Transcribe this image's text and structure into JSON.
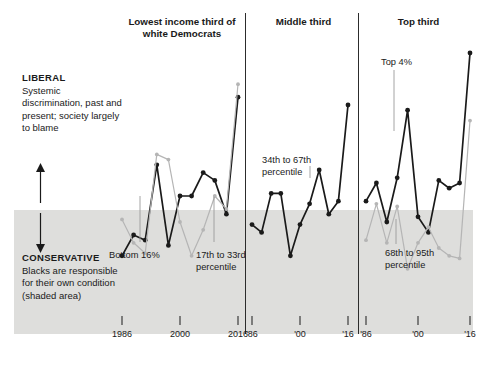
{
  "axis_labels": {
    "liberal": {
      "caption": "LIBERAL",
      "body": "Systemic discrimination, past and present; society largely to blame"
    },
    "conservative": {
      "caption": "CONSERVATIVE",
      "body": "Blacks are responsible for their own condition (shaded area)"
    },
    "up_arrow_icon": "up-arrow-icon",
    "down_arrow_icon": "down-arrow-icon"
  },
  "panels": [
    {
      "title": "Lowest income third of white Democrats",
      "ticks": [
        "1986",
        "2000",
        "2016"
      ]
    },
    {
      "title": "Middle third",
      "ticks": [
        "'86",
        "'00",
        "'16"
      ]
    },
    {
      "title": "Top third",
      "ticks": [
        "'86",
        "'00",
        "'16"
      ]
    }
  ],
  "annotations": {
    "bottom16": "Bottom 16%",
    "p17to33": "17th to 33rd percentile",
    "p34to67": "34th to 67th percentile",
    "top4": "Top 4%",
    "p68to95": "68th to 95th percentile"
  },
  "colors": {
    "dark_series": "#1a1a1a",
    "light_series": "#b5b5b5",
    "shaded_band": "#dededc",
    "divider": "#2c2c2c",
    "text": "#1a1a1a"
  },
  "chart_data": {
    "type": "line",
    "title": "",
    "subtitle": "",
    "xlabel": "",
    "ylabel": "",
    "grid": false,
    "legend_position": "inline-annotations",
    "y_axis_description": "Scale runs from CONSERVATIVE (Blacks are responsible for their own condition — shaded lower area) at the bottom to LIBERAL (Systemic discrimination, past and present; society largely to blame) at the top",
    "shaded_region": {
      "label": "CONSERVATIVE (shaded area)",
      "y_from_bottom": 0,
      "y_to": 0.37
    },
    "panels": [
      {
        "name": "Lowest income third of white Democrats",
        "x_ticks": [
          "1986",
          "2000",
          "2016"
        ],
        "x": [
          1986,
          1988,
          1990,
          1992,
          1994,
          1996,
          2000,
          2004,
          2008,
          2012,
          2016
        ],
        "series": [
          {
            "name": "Bottom 16%",
            "color": "#1a1a1a",
            "values": [
              0.17,
              0.25,
              0.23,
              0.52,
              0.21,
              0.4,
              0.4,
              0.49,
              0.46,
              0.33,
              0.78
            ]
          },
          {
            "name": "17th to 33rd percentile",
            "color": "#b5b5b5",
            "values": [
              0.31,
              0.22,
              0.18,
              0.56,
              0.54,
              0.3,
              0.17,
              0.27,
              0.4,
              0.35,
              0.83
            ]
          }
        ]
      },
      {
        "name": "Middle third",
        "x_ticks": [
          "'86",
          "'00",
          "'16"
        ],
        "x": [
          1986,
          1988,
          1990,
          1992,
          1994,
          1996,
          2000,
          2004,
          2008,
          2012,
          2016
        ],
        "series": [
          {
            "name": "34th to 67th percentile",
            "color": "#1a1a1a",
            "values": [
              0.29,
              0.26,
              0.41,
              0.41,
              0.17,
              0.29,
              0.37,
              0.5,
              0.33,
              0.38,
              0.75
            ]
          }
        ]
      },
      {
        "name": "Top third",
        "x_ticks": [
          "'86",
          "'00",
          "'16"
        ],
        "x": [
          1986,
          1988,
          1990,
          1992,
          1994,
          1996,
          2000,
          2004,
          2008,
          2012,
          2016
        ],
        "series": [
          {
            "name": "Top 4%",
            "color": "#1a1a1a",
            "values": [
              0.38,
              0.45,
              0.3,
              0.47,
              0.73,
              0.32,
              0.26,
              0.46,
              0.43,
              0.45,
              0.95
            ]
          },
          {
            "name": "68th to 95th percentile",
            "color": "#b5b5b5",
            "values": [
              0.23,
              0.37,
              0.22,
              0.36,
              0.12,
              0.22,
              0.28,
              0.2,
              0.17,
              0.16,
              0.69
            ]
          }
        ]
      }
    ]
  }
}
